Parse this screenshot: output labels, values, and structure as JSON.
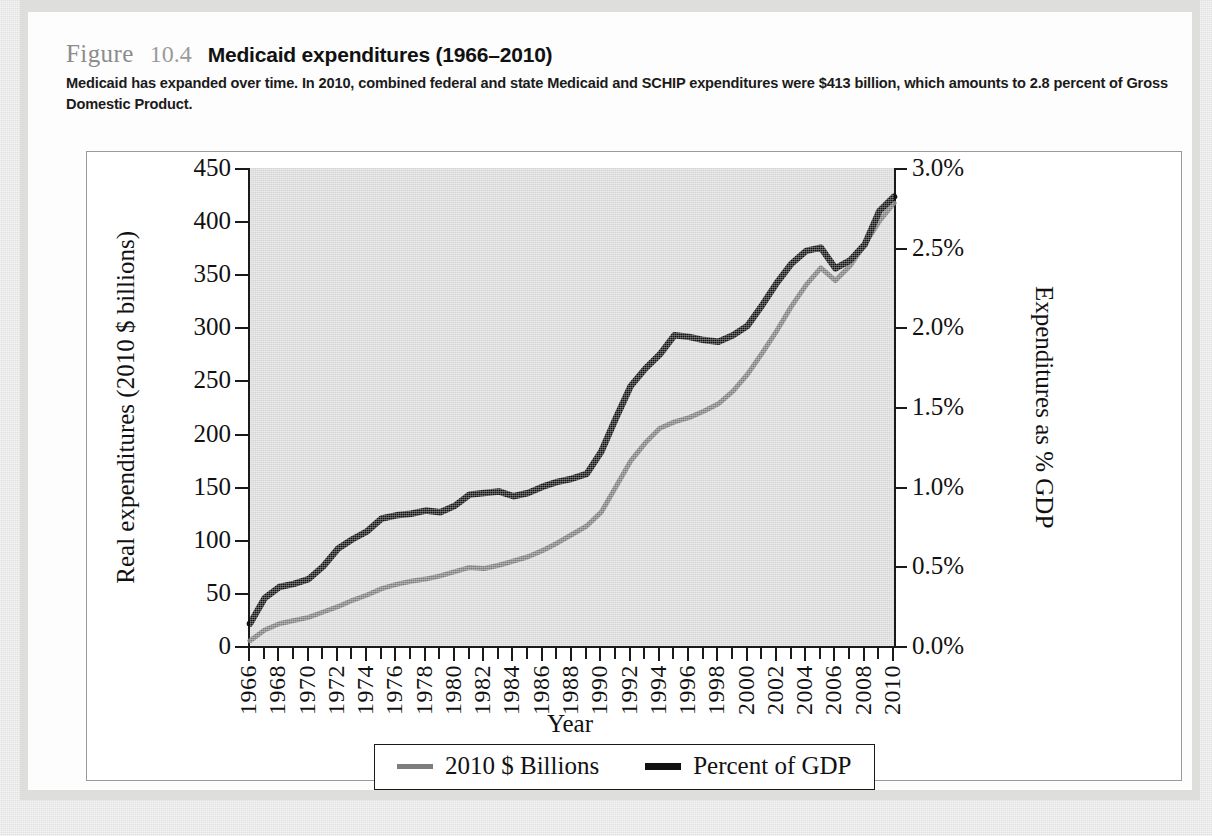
{
  "figure": {
    "label": "Figure",
    "number": "10.4",
    "title": "Medicaid expenditures (1966–2010)",
    "description": "Medicaid has expanded over time. In 2010, combined federal and state Medicaid and SCHIP expenditures were $413 billion, which amounts to 2.8 percent of Gross Domestic Product."
  },
  "chart_data": {
    "type": "line",
    "title": "Medicaid expenditures (1966–2010)",
    "xlabel": "Year",
    "grid": false,
    "legend_position": "bottom-center",
    "x": [
      1966,
      1967,
      1968,
      1969,
      1970,
      1971,
      1972,
      1973,
      1974,
      1975,
      1976,
      1977,
      1978,
      1979,
      1980,
      1981,
      1982,
      1983,
      1984,
      1985,
      1986,
      1987,
      1988,
      1989,
      1990,
      1991,
      1992,
      1993,
      1994,
      1995,
      1996,
      1997,
      1998,
      1999,
      2000,
      2001,
      2002,
      2003,
      2004,
      2005,
      2006,
      2007,
      2008,
      2009,
      2010
    ],
    "xtick_labels": [
      "1966",
      "1968",
      "1970",
      "1972",
      "1974",
      "1976",
      "1978",
      "1980",
      "1982",
      "1984",
      "1986",
      "1988",
      "1990",
      "1992",
      "1994",
      "1996",
      "1998",
      "2000",
      "2002",
      "2004",
      "2006",
      "2008",
      "2010"
    ],
    "axes": {
      "left": {
        "label": "Real expenditures (2010 $ billions)",
        "ylim": [
          0,
          450
        ],
        "ticks": [
          0,
          50,
          100,
          150,
          200,
          250,
          300,
          350,
          400,
          450
        ],
        "tick_labels": [
          "0",
          "50",
          "100",
          "150",
          "200",
          "250",
          "300",
          "350",
          "400",
          "450"
        ]
      },
      "right": {
        "label": "Expenditures as % GDP",
        "ylim": [
          0.0,
          3.0
        ],
        "ticks": [
          0.0,
          0.5,
          1.0,
          1.5,
          2.0,
          2.5,
          3.0
        ],
        "tick_labels": [
          "0.0%",
          "0.5%",
          "1.0%",
          "1.5%",
          "2.0%",
          "2.5%",
          "3.0%"
        ]
      }
    },
    "series": [
      {
        "name": "2010 $ Billions",
        "axis": "left",
        "color": "#7d7d7d",
        "unit": "billions of 2010 dollars",
        "values": [
          5,
          15,
          21,
          24,
          27,
          32,
          37,
          43,
          48,
          54,
          58,
          61,
          63,
          66,
          70,
          74,
          73,
          76,
          80,
          84,
          90,
          97,
          105,
          113,
          126,
          150,
          174,
          191,
          205,
          211,
          215,
          221,
          228,
          240,
          256,
          276,
          297,
          320,
          340,
          356,
          344,
          358,
          378,
          400,
          417
        ]
      },
      {
        "name": "Percent of GDP",
        "axis": "right",
        "color": "#111111",
        "unit": "percent of GDP",
        "values": [
          0.14,
          0.3,
          0.37,
          0.39,
          0.42,
          0.5,
          0.61,
          0.67,
          0.72,
          0.8,
          0.82,
          0.83,
          0.85,
          0.84,
          0.88,
          0.95,
          0.96,
          0.97,
          0.94,
          0.96,
          1.0,
          1.03,
          1.05,
          1.08,
          1.22,
          1.43,
          1.63,
          1.74,
          1.83,
          1.95,
          1.94,
          1.92,
          1.91,
          1.95,
          2.01,
          2.14,
          2.28,
          2.4,
          2.48,
          2.5,
          2.37,
          2.42,
          2.52,
          2.73,
          2.82
        ]
      }
    ]
  },
  "legend": {
    "items": [
      {
        "label": "2010 $ Billions",
        "color": "#7d7d7d"
      },
      {
        "label": "Percent of GDP",
        "color": "#111111"
      }
    ]
  }
}
